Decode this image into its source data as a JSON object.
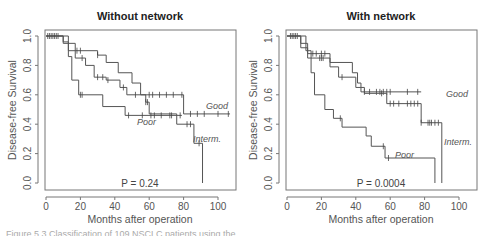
{
  "chart_data": [
    {
      "type": "line",
      "subtype": "kaplan-meier step",
      "title": "Without network",
      "xlabel": "Months after operation",
      "ylabel": "Disease-free Survival",
      "xlim": [
        0,
        110
      ],
      "ylim": [
        0,
        1.0
      ],
      "xticks": [
        "0",
        "20",
        "40",
        "60",
        "80",
        "100"
      ],
      "yticks": [
        "0.0",
        "0.2",
        "0.4",
        "0.6",
        "0.8",
        "1.0"
      ],
      "grid": false,
      "annotation": "P = 0.24",
      "series": [
        {
          "name": "Good",
          "x": [
            0,
            10,
            13,
            30,
            35,
            42,
            50,
            55,
            80,
            107
          ],
          "y": [
            1.0,
            0.96,
            0.9,
            0.87,
            0.82,
            0.75,
            0.68,
            0.6,
            0.47,
            0.47
          ],
          "censor_x": [
            2,
            4,
            6,
            18,
            20,
            30,
            60,
            62,
            66,
            70,
            74,
            79,
            84,
            88,
            92,
            100,
            106
          ]
        },
        {
          "name": "Interm.",
          "x": [
            0,
            10,
            17,
            23,
            28,
            35,
            43,
            47,
            58,
            60,
            76,
            86,
            91
          ],
          "y": [
            1.0,
            0.95,
            0.85,
            0.8,
            0.72,
            0.7,
            0.65,
            0.6,
            0.55,
            0.47,
            0.4,
            0.27,
            0.0
          ],
          "censor_x": [
            3,
            7,
            21,
            30,
            33,
            36,
            45,
            52,
            58,
            59,
            82,
            84,
            89
          ]
        },
        {
          "name": "Poor",
          "x": [
            0,
            13,
            15,
            19,
            33,
            46,
            79
          ],
          "y": [
            1.0,
            0.86,
            0.7,
            0.6,
            0.52,
            0.46,
            0.46
          ],
          "censor_x": [
            1,
            5,
            20,
            21,
            48,
            56,
            61,
            63,
            67,
            72,
            73,
            78
          ]
        }
      ]
    },
    {
      "type": "line",
      "subtype": "kaplan-meier step",
      "title": "With network",
      "xlabel": "Months after operation",
      "ylabel": "Disease-free Survival",
      "xlim": [
        0,
        110
      ],
      "ylim": [
        0,
        1.0
      ],
      "xticks": [
        "0",
        "20",
        "40",
        "60",
        "80",
        "100"
      ],
      "yticks": [
        "0.0",
        "0.2",
        "0.4",
        "0.6",
        "0.8",
        "1.0"
      ],
      "grid": false,
      "annotation": "P = 0.0004",
      "series": [
        {
          "name": "Good",
          "x": [
            0,
            8,
            12,
            25,
            38,
            41,
            43,
            78
          ],
          "y": [
            1.0,
            0.95,
            0.88,
            0.82,
            0.75,
            0.68,
            0.62,
            0.62
          ],
          "censor_x": [
            2,
            4,
            6,
            15,
            17,
            20,
            22,
            45,
            48,
            52,
            54,
            56,
            58,
            60,
            70,
            76
          ]
        },
        {
          "name": "Interm.",
          "x": [
            0,
            8,
            12,
            25,
            30,
            40,
            45,
            58,
            78,
            88,
            90
          ],
          "y": [
            1.0,
            0.92,
            0.85,
            0.79,
            0.72,
            0.65,
            0.61,
            0.54,
            0.41,
            0.41,
            0.0
          ],
          "censor_x": [
            3,
            5,
            19,
            20,
            21,
            32,
            55,
            60,
            62,
            65,
            70,
            72,
            74,
            76,
            78,
            84,
            86,
            88,
            96,
            104,
            106,
            82,
            83
          ]
        },
        {
          "name": "Poor",
          "x": [
            0,
            11,
            14,
            16,
            22,
            27,
            32,
            46,
            49,
            57,
            86
          ],
          "y": [
            1.0,
            0.9,
            0.75,
            0.6,
            0.5,
            0.44,
            0.38,
            0.32,
            0.25,
            0.17,
            0.0
          ],
          "censor_x": [
            31,
            56,
            59
          ]
        }
      ]
    }
  ],
  "panels": [
    {
      "title": "Without network",
      "ylabel": "Disease-free Survival",
      "xlabel": "Months after operation",
      "pvalue": "P = 0.24",
      "labels": {
        "good": "Good",
        "interm": "Interm.",
        "poor": "Poor"
      }
    },
    {
      "title": "With network",
      "ylabel": "Disease-free Survival",
      "xlabel": "Months after operation",
      "pvalue": "P = 0.0004",
      "labels": {
        "good": "Good",
        "interm": "Interm.",
        "poor": "Poor"
      }
    }
  ],
  "ticks": {
    "x": [
      "0",
      "20",
      "40",
      "60",
      "80",
      "100"
    ],
    "y": [
      "0.0",
      "0.2",
      "0.4",
      "0.6",
      "0.8",
      "1.0"
    ]
  },
  "caption": "Figure 5.3  Classification of 109 NSCLC patients using the ..."
}
